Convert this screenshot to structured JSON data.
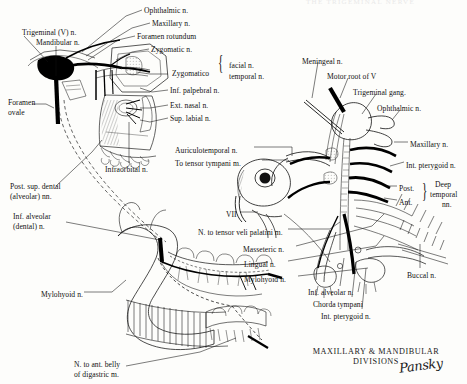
{
  "figure": {
    "top_header": "THE TRIGEMINAL NERVE",
    "title_line1": "MAXILLARY & MANDIBULAR",
    "title_line2": "DIVISIONS",
    "signature": "Pansky",
    "ink_color": "#111111",
    "paper_color": "#fdfdfb"
  },
  "left_panel": {
    "name": "maxillary-mandibular-distribution-lateral-view",
    "labels": [
      {
        "id": "trigeminal-v-n",
        "text": "Trigeminal (V) n.",
        "x": 22,
        "y": 28,
        "align": "left"
      },
      {
        "id": "mandibular-n",
        "text": "Mandibular n.",
        "x": 36,
        "y": 38,
        "align": "left"
      },
      {
        "id": "ophthalmic-n",
        "text": "Ophthalmic n.",
        "x": 144,
        "y": 6,
        "align": "left"
      },
      {
        "id": "maxillary-n-left",
        "text": "Maxillary n.",
        "x": 152,
        "y": 19,
        "align": "left"
      },
      {
        "id": "foramen-rotundum",
        "text": "Foramen rotundum",
        "x": 137,
        "y": 32,
        "align": "left"
      },
      {
        "id": "zygomatic-n",
        "text": "Zygomatic n.",
        "x": 151,
        "y": 45,
        "align": "left"
      },
      {
        "id": "zygomatico",
        "text": "Zygomatico",
        "x": 172,
        "y": 69,
        "align": "left"
      },
      {
        "id": "facial-n",
        "text": "facial n.",
        "x": 229,
        "y": 61,
        "align": "left"
      },
      {
        "id": "temporal-n",
        "text": "temporal n.",
        "x": 229,
        "y": 72,
        "align": "left"
      },
      {
        "id": "inf-palpebral-n",
        "text": "Inf. palpebral n.",
        "x": 170,
        "y": 86,
        "align": "left"
      },
      {
        "id": "ext-nasal-n",
        "text": "Ext. nasal n.",
        "x": 170,
        "y": 101,
        "align": "left"
      },
      {
        "id": "sup-labial-n",
        "text": "Sup. labial n.",
        "x": 170,
        "y": 114,
        "align": "left"
      },
      {
        "id": "foramen-ovale-1",
        "text": "Foramen",
        "x": 8,
        "y": 98,
        "align": "left"
      },
      {
        "id": "foramen-ovale-2",
        "text": "ovale",
        "x": 8,
        "y": 108,
        "align": "left"
      },
      {
        "id": "infraorbital-n",
        "text": "Infraorbital n.",
        "x": 105,
        "y": 165,
        "align": "left"
      },
      {
        "id": "post-sup-dental-1",
        "text": "Post. sup. dental",
        "x": 10,
        "y": 182,
        "align": "left"
      },
      {
        "id": "post-sup-dental-2",
        "text": "(alveolar) nn.",
        "x": 10,
        "y": 192,
        "align": "left"
      },
      {
        "id": "inf-alveolar-left-1",
        "text": "Inf. alveolar",
        "x": 13,
        "y": 212,
        "align": "left"
      },
      {
        "id": "inf-alveolar-left-2",
        "text": "(dental) n.",
        "x": 13,
        "y": 222,
        "align": "left"
      },
      {
        "id": "mylohyoid-n-left",
        "text": "Mylohyoid n.",
        "x": 41,
        "y": 290,
        "align": "left"
      },
      {
        "id": "n-ant-belly-digastric-1",
        "text": "N. to ant. belly",
        "x": 74,
        "y": 360,
        "align": "left"
      },
      {
        "id": "n-ant-belly-digastric-2",
        "text": "of digastric m.",
        "x": 74,
        "y": 370,
        "align": "left"
      }
    ]
  },
  "right_panel": {
    "name": "trigeminal-ganglion-branches-schematic",
    "labels": [
      {
        "id": "meningeal-n",
        "text": "Meningeal n.",
        "x": 302,
        "y": 57,
        "align": "left"
      },
      {
        "id": "motor-root-of-v",
        "text": "Motor root of V",
        "x": 327,
        "y": 72,
        "align": "left"
      },
      {
        "id": "trigeminal-gang",
        "text": "Trigeminal gang.",
        "x": 353,
        "y": 88,
        "align": "left"
      },
      {
        "id": "ophthalmic-n-right",
        "text": "Ophthalmic n.",
        "x": 377,
        "y": 104,
        "align": "left"
      },
      {
        "id": "maxillary-n-right",
        "text": "Maxillary n.",
        "x": 410,
        "y": 140,
        "align": "left"
      },
      {
        "id": "int-pterygoid-n-top",
        "text": "Int. pterygoid n.",
        "x": 406,
        "y": 161,
        "align": "left"
      },
      {
        "id": "post-branch",
        "text": "Post.",
        "x": 399,
        "y": 184,
        "align": "left"
      },
      {
        "id": "ant-branch",
        "text": "Ant.",
        "x": 399,
        "y": 198,
        "align": "left"
      },
      {
        "id": "deep-temporal-1",
        "text": "Deep",
        "x": 435,
        "y": 180,
        "align": "left"
      },
      {
        "id": "deep-temporal-2",
        "text": "temporal",
        "x": 430,
        "y": 190,
        "align": "left"
      },
      {
        "id": "deep-temporal-3",
        "text": "nn.",
        "x": 442,
        "y": 200,
        "align": "left"
      },
      {
        "id": "auriculotemporal-n",
        "text": "Auriculotemporal n.",
        "x": 175,
        "y": 146,
        "align": "left"
      },
      {
        "id": "to-tensor-tympani",
        "text": "To tensor tympani m.",
        "x": 175,
        "y": 159,
        "align": "left"
      },
      {
        "id": "vii",
        "text": "VII",
        "x": 226,
        "y": 210,
        "align": "left"
      },
      {
        "id": "n-tensor-veli-palatini",
        "text": "N. to tensor veli palatini m.",
        "x": 198,
        "y": 228,
        "align": "left"
      },
      {
        "id": "masseteric-n",
        "text": "Masseteric n.",
        "x": 243,
        "y": 245,
        "align": "left"
      },
      {
        "id": "lingual-n",
        "text": "Lingual n.",
        "x": 244,
        "y": 260,
        "align": "left"
      },
      {
        "id": "mylohyoid-n-right",
        "text": "Mylohyoid n.",
        "x": 244,
        "y": 275,
        "align": "left"
      },
      {
        "id": "inf-alveolar-n-right",
        "text": "Inf. alveolar n.",
        "x": 308,
        "y": 288,
        "align": "left"
      },
      {
        "id": "chorda-tympani",
        "text": "Chorda tympani",
        "x": 313,
        "y": 300,
        "align": "left"
      },
      {
        "id": "int-pterygoid-n-bottom",
        "text": "Int. pterygoid n.",
        "x": 321,
        "y": 312,
        "align": "left"
      },
      {
        "id": "buccal-n",
        "text": "Buccal n.",
        "x": 407,
        "y": 271,
        "align": "left"
      }
    ]
  }
}
